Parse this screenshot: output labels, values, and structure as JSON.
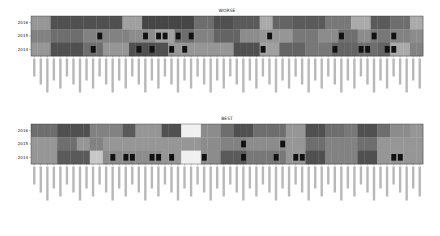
{
  "chart_data": [
    {
      "type": "heatmap",
      "title": "WORSE",
      "rows": [
        "2016",
        "2015",
        "2014"
      ],
      "n_columns": 60,
      "column_labels_note": "Rotated per-column labels (unreadable at source resolution)",
      "values": [
        [
          0.55,
          0.55,
          0.55,
          0.2,
          0.2,
          0.2,
          0.2,
          0.2,
          0.2,
          0.2,
          0.2,
          0.2,
          0.2,
          0.2,
          0.6,
          0.6,
          0.6,
          0.15,
          0.15,
          0.15,
          0.15,
          0.15,
          0.15,
          0.15,
          0.15,
          0.35,
          0.35,
          0.35,
          0.2,
          0.2,
          0.2,
          0.25,
          0.25,
          0.25,
          0.25,
          0.65,
          0.65,
          0.3,
          0.3,
          0.3,
          0.25,
          0.25,
          0.25,
          0.25,
          0.25,
          0.4,
          0.4,
          0.4,
          0.4,
          0.65,
          0.65,
          0.65,
          0.25,
          0.25,
          0.25,
          0.35,
          0.35,
          0.35,
          0.65,
          0.65
        ],
        [
          0.45,
          0.45,
          0.45,
          0.35,
          0.35,
          0.35,
          0.35,
          0.35,
          0.45,
          0.45,
          0.45,
          0.45,
          0.45,
          0.45,
          0.45,
          0.5,
          0.5,
          0.5,
          0.5,
          0.6,
          0.6,
          0.6,
          0.35,
          0.35,
          0.35,
          0.45,
          0.45,
          0.45,
          0.3,
          0.3,
          0.3,
          0.3,
          0.5,
          0.5,
          0.5,
          0.55,
          0.55,
          0.55,
          0.55,
          0.55,
          0.4,
          0.4,
          0.4,
          0.4,
          0.5,
          0.5,
          0.5,
          0.35,
          0.35,
          0.35,
          0.5,
          0.5,
          0.4,
          0.4,
          0.4,
          0.45,
          0.45,
          0.45,
          0.5,
          0.5
        ],
        [
          0.55,
          0.55,
          0.55,
          0.2,
          0.2,
          0.2,
          0.2,
          0.2,
          0.35,
          0.35,
          0.35,
          0.55,
          0.55,
          0.55,
          0.55,
          0.2,
          0.2,
          0.2,
          0.2,
          0.2,
          0.2,
          0.55,
          0.55,
          0.55,
          0.55,
          0.55,
          0.55,
          0.55,
          0.55,
          0.55,
          0.55,
          0.2,
          0.2,
          0.2,
          0.2,
          0.6,
          0.6,
          0.6,
          0.3,
          0.3,
          0.3,
          0.3,
          0.4,
          0.4,
          0.4,
          0.4,
          0.3,
          0.3,
          0.3,
          0.3,
          0.35,
          0.35,
          0.35,
          0.3,
          0.3,
          0.65,
          0.65,
          0.65,
          0.45,
          0.45
        ]
      ],
      "black_markers": [
        [
          1,
          10
        ],
        [
          2,
          9
        ],
        [
          1,
          17
        ],
        [
          2,
          16
        ],
        [
          1,
          19
        ],
        [
          2,
          18
        ],
        [
          1,
          20
        ],
        [
          2,
          21
        ],
        [
          1,
          22
        ],
        [
          1,
          24
        ],
        [
          2,
          23
        ],
        [
          1,
          36
        ],
        [
          2,
          35
        ],
        [
          1,
          47
        ],
        [
          2,
          46
        ],
        [
          2,
          50
        ],
        [
          1,
          52
        ],
        [
          2,
          51
        ],
        [
          2,
          54
        ],
        [
          1,
          55
        ],
        [
          2,
          55
        ]
      ]
    },
    {
      "type": "heatmap",
      "title": "BEST",
      "rows": [
        "2016",
        "2015",
        "2014"
      ],
      "n_columns": 60,
      "column_labels_note": "Rotated per-column labels (unreadable at source resolution)",
      "values": [
        [
          0.35,
          0.35,
          0.35,
          0.35,
          0.2,
          0.2,
          0.2,
          0.2,
          0.2,
          0.45,
          0.45,
          0.45,
          0.45,
          0.45,
          0.25,
          0.25,
          0.55,
          0.55,
          0.55,
          0.55,
          0.2,
          0.2,
          0.2,
          1.0,
          1.0,
          1.0,
          0.5,
          0.5,
          0.5,
          0.35,
          0.35,
          0.2,
          0.2,
          0.2,
          0.35,
          0.35,
          0.35,
          0.35,
          0.35,
          0.55,
          0.55,
          0.55,
          0.2,
          0.2,
          0.2,
          0.35,
          0.35,
          0.35,
          0.4,
          0.4,
          0.2,
          0.2,
          0.2,
          0.35,
          0.35,
          0.5,
          0.5,
          0.5,
          0.55,
          0.55
        ],
        [
          0.55,
          0.55,
          0.55,
          0.55,
          0.35,
          0.35,
          0.35,
          0.55,
          0.55,
          0.45,
          0.45,
          0.55,
          0.55,
          0.55,
          0.55,
          0.55,
          0.55,
          0.55,
          0.55,
          0.55,
          0.55,
          0.55,
          0.55,
          0.55,
          0.55,
          0.55,
          0.5,
          0.5,
          0.5,
          0.45,
          0.45,
          0.45,
          0.45,
          0.5,
          0.5,
          0.5,
          0.5,
          0.5,
          0.5,
          0.55,
          0.55,
          0.55,
          0.35,
          0.35,
          0.35,
          0.45,
          0.45,
          0.45,
          0.45,
          0.45,
          0.35,
          0.35,
          0.35,
          0.55,
          0.55,
          0.55,
          0.55,
          0.55,
          0.55,
          0.55
        ],
        [
          0.55,
          0.55,
          0.55,
          0.55,
          0.25,
          0.25,
          0.25,
          0.25,
          0.25,
          0.8,
          0.8,
          0.5,
          0.5,
          0.5,
          0.5,
          0.5,
          0.5,
          0.5,
          0.5,
          0.5,
          0.55,
          0.55,
          0.55,
          1.0,
          1.0,
          1.0,
          0.5,
          0.5,
          0.5,
          0.25,
          0.25,
          0.25,
          0.25,
          0.4,
          0.4,
          0.4,
          0.4,
          0.4,
          0.4,
          0.55,
          0.55,
          0.55,
          0.2,
          0.2,
          0.2,
          0.45,
          0.45,
          0.45,
          0.45,
          0.45,
          0.2,
          0.2,
          0.2,
          0.55,
          0.55,
          0.55,
          0.55,
          0.55,
          0.55,
          0.55
        ]
      ],
      "black_markers": [
        [
          2,
          12
        ],
        [
          2,
          14
        ],
        [
          2,
          15
        ],
        [
          2,
          18
        ],
        [
          2,
          21
        ],
        [
          2,
          19
        ],
        [
          2,
          26
        ],
        [
          1,
          32
        ],
        [
          2,
          32
        ],
        [
          2,
          40
        ],
        [
          2,
          41
        ],
        [
          1,
          38
        ],
        [
          2,
          37
        ],
        [
          2,
          55
        ],
        [
          2,
          56
        ]
      ]
    }
  ]
}
